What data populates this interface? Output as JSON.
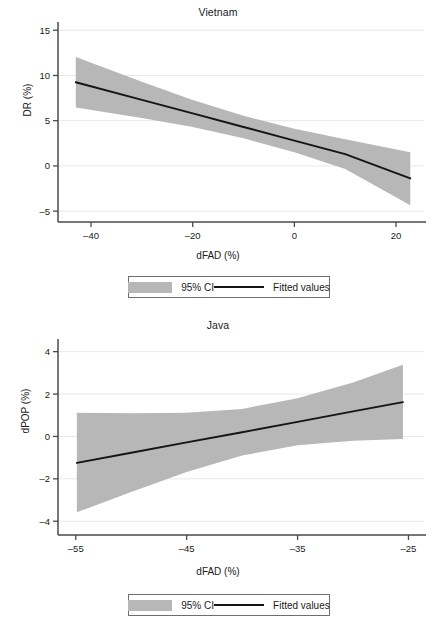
{
  "figure": {
    "panels": [
      "vietnam",
      "java"
    ],
    "legend_labels": {
      "ci": "95% CI",
      "fit": "Fitted values"
    }
  },
  "chart_data": [
    {
      "id": "vietnam",
      "type": "line",
      "title": "Vietnam",
      "xlabel": "dFAD (%)",
      "ylabel": "DR (%)",
      "xlim": [
        -46.5,
        25.5
      ],
      "ylim": [
        -6.2,
        15.8
      ],
      "xticks": [
        -40,
        -20,
        0,
        20
      ],
      "xticklabels": [
        "–40",
        "–20",
        "0",
        "20"
      ],
      "yticks": [
        -5,
        0,
        5,
        10,
        15
      ],
      "yticklabels": [
        "–5",
        "0",
        "5",
        "10",
        "15"
      ],
      "grid": "horizontal",
      "legend_position": "below-outside",
      "series": [
        {
          "name": "Fitted values",
          "color": "#141414",
          "x": [
            -43.0,
            -30.0,
            -20.0,
            -10.0,
            0.0,
            10.0,
            22.8
          ],
          "values": [
            9.25,
            7.3,
            5.8,
            4.3,
            2.8,
            1.3,
            -1.38
          ]
        },
        {
          "name": "95% CI",
          "color": "#b7b7b7",
          "x": [
            -43.0,
            -30.0,
            -20.0,
            -10.0,
            0.0,
            10.0,
            22.8
          ],
          "upper": [
            12.05,
            9.3,
            7.3,
            5.55,
            4.1,
            2.95,
            1.5
          ],
          "lower": [
            6.45,
            5.3,
            4.3,
            3.05,
            1.5,
            -0.35,
            -4.35
          ]
        }
      ]
    },
    {
      "id": "java",
      "type": "line",
      "title": "Java",
      "xlabel": "dFAD (%)",
      "ylabel": "dPOP (%)",
      "xlim": [
        -56.6,
        -23.6
      ],
      "ylim": [
        -4.65,
        4.55
      ],
      "xticks": [
        -55,
        -45,
        -35,
        -25
      ],
      "xticklabels": [
        "–55",
        "–45",
        "–35",
        "–25"
      ],
      "yticks": [
        -4,
        -2,
        0,
        2,
        4
      ],
      "yticklabels": [
        "–4",
        "–2",
        "0",
        "2",
        "4"
      ],
      "grid": "horizontal",
      "legend_position": "below-outside",
      "series": [
        {
          "name": "Fitted values",
          "color": "#141414",
          "x": [
            -54.9,
            -50.0,
            -45.0,
            -40.0,
            -35.0,
            -30.0,
            -25.5
          ],
          "values": [
            -1.25,
            -0.77,
            -0.28,
            0.2,
            0.69,
            1.18,
            1.62
          ]
        },
        {
          "name": "95% CI",
          "color": "#b7b7b7",
          "x": [
            -54.9,
            -50.0,
            -45.0,
            -40.0,
            -35.0,
            -30.0,
            -25.5
          ],
          "upper": [
            1.12,
            1.1,
            1.12,
            1.3,
            1.8,
            2.55,
            3.38
          ],
          "lower": [
            -3.58,
            -2.62,
            -1.68,
            -0.9,
            -0.42,
            -0.2,
            -0.12
          ]
        }
      ]
    }
  ]
}
